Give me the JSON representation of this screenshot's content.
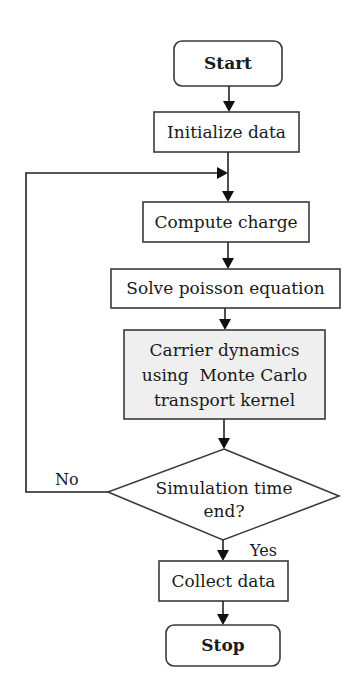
{
  "diagram": {
    "type": "flowchart",
    "nodes": {
      "start": {
        "label": "Start",
        "shape": "rounded-rect"
      },
      "initialize": {
        "label": "Initialize data",
        "shape": "rect"
      },
      "compute": {
        "label": "Compute charge",
        "shape": "rect"
      },
      "solve": {
        "label": "Solve poisson equation",
        "shape": "rect"
      },
      "carrier": {
        "lines": [
          "Carrier dynamics",
          "using  Monte Carlo",
          "transport kernel"
        ],
        "shape": "rect",
        "fill": "#efefef"
      },
      "decision": {
        "lines": [
          "Simulation time",
          "end?"
        ],
        "shape": "diamond"
      },
      "collect": {
        "label": "Collect data",
        "shape": "rect"
      },
      "stop": {
        "label": "Stop",
        "shape": "rounded-rect"
      }
    },
    "edges": {
      "no_label": "No",
      "yes_label": "Yes"
    },
    "colors": {
      "stroke": "#3a3a3a",
      "shaded_fill": "#efefef",
      "background": "#ffffff"
    }
  }
}
